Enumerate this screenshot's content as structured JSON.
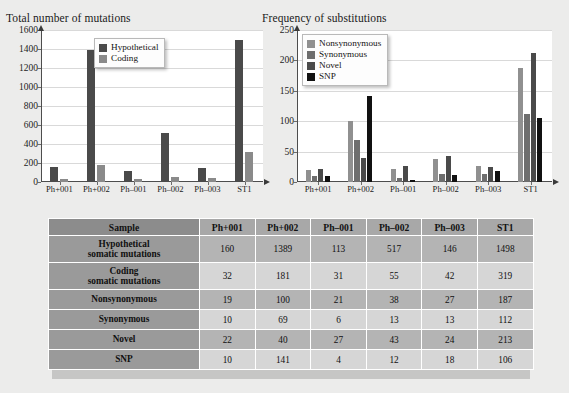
{
  "charts": [
    {
      "title": "Total number of mutations",
      "ylim": [
        0,
        1600
      ],
      "ystep": 200,
      "yticks": [
        "0",
        "200",
        "400",
        "600",
        "800",
        "1000",
        "1200",
        "1400",
        "1600"
      ],
      "categories": [
        "Ph+001",
        "Ph+002",
        "Ph–001",
        "Ph–002",
        "Ph–003",
        "ST1"
      ],
      "legend": [
        {
          "label": "Hypothetical",
          "color": "#4a4a4a"
        },
        {
          "label": "Coding",
          "color": "#8a8a8a"
        }
      ],
      "series": [
        {
          "name": "Hypothetical",
          "color": "#4a4a4a",
          "values": [
            160,
            1389,
            113,
            517,
            146,
            1498
          ]
        },
        {
          "name": "Coding",
          "color": "#8a8a8a",
          "values": [
            32,
            181,
            31,
            55,
            42,
            319
          ]
        }
      ]
    },
    {
      "title": "Frequency of substitutions",
      "ylim": [
        0,
        250
      ],
      "ystep": 50,
      "yticks": [
        "0",
        "50",
        "100",
        "150",
        "200",
        "250"
      ],
      "categories": [
        "Ph+001",
        "Ph+002",
        "Ph–001",
        "Ph–002",
        "Ph–003",
        "ST1"
      ],
      "legend": [
        {
          "label": "Nonsynonymous",
          "color": "#909090"
        },
        {
          "label": "Synonymous",
          "color": "#6e6e6e"
        },
        {
          "label": "Novel",
          "color": "#4a4a4a"
        },
        {
          "label": "SNP",
          "color": "#111111"
        }
      ],
      "series": [
        {
          "name": "Nonsynonymous",
          "color": "#909090",
          "values": [
            19,
            100,
            21,
            38,
            27,
            187
          ]
        },
        {
          "name": "Synonymous",
          "color": "#6e6e6e",
          "values": [
            10,
            69,
            6,
            13,
            13,
            112
          ]
        },
        {
          "name": "Novel",
          "color": "#4a4a4a",
          "values": [
            22,
            40,
            27,
            43,
            24,
            213
          ]
        },
        {
          "name": "SNP",
          "color": "#111111",
          "values": [
            10,
            141,
            4,
            12,
            18,
            106
          ]
        }
      ]
    }
  ],
  "table": {
    "header": [
      "Sample",
      "Ph+001",
      "Ph+002",
      "Ph–001",
      "Ph–002",
      "Ph–003",
      "ST1"
    ],
    "rows": [
      {
        "label": "Hypothetical\nsomatic mutations",
        "label_lines": [
          "Hypothetical",
          "somatic mutations"
        ],
        "values": [
          "160",
          "1389",
          "113",
          "517",
          "146",
          "1498"
        ]
      },
      {
        "label": "Coding\nsomatic mutations",
        "label_lines": [
          "Coding",
          "somatic mutations"
        ],
        "values": [
          "32",
          "181",
          "31",
          "55",
          "42",
          "319"
        ]
      },
      {
        "label": "Nonsynonymous",
        "label_lines": [
          "Nonsynonymous"
        ],
        "values": [
          "19",
          "100",
          "21",
          "38",
          "27",
          "187"
        ]
      },
      {
        "label": "Synonymous",
        "label_lines": [
          "Synonymous"
        ],
        "values": [
          "10",
          "69",
          "6",
          "13",
          "13",
          "112"
        ]
      },
      {
        "label": "Novel",
        "label_lines": [
          "Novel"
        ],
        "values": [
          "22",
          "40",
          "27",
          "43",
          "24",
          "213"
        ]
      },
      {
        "label": "SNP",
        "label_lines": [
          "10",
          "141",
          "4",
          "12",
          "18",
          "106"
        ],
        "values": [
          "10",
          "141",
          "4",
          "12",
          "18",
          "106"
        ]
      }
    ],
    "row_labels": [
      "Hypothetical somatic mutations",
      "Coding somatic mutations",
      "Nonsynonymous",
      "Synonymous",
      "Novel",
      "SNP"
    ]
  },
  "chart_data": [
    {
      "type": "bar",
      "title": "Total number of mutations",
      "xlabel": "",
      "ylabel": "",
      "ylim": [
        0,
        1600
      ],
      "grid": true,
      "legend_position": "top-center",
      "categories": [
        "Ph+001",
        "Ph+002",
        "Ph–001",
        "Ph–002",
        "Ph–003",
        "ST1"
      ],
      "tick_labels_y": [
        0,
        200,
        400,
        600,
        800,
        1000,
        1200,
        1400,
        1600
      ],
      "series": [
        {
          "name": "Hypothetical",
          "values": [
            160,
            1389,
            113,
            517,
            146,
            1498
          ]
        },
        {
          "name": "Coding",
          "values": [
            32,
            181,
            31,
            55,
            42,
            319
          ]
        }
      ]
    },
    {
      "type": "bar",
      "title": "Frequency of substitutions",
      "xlabel": "",
      "ylabel": "",
      "ylim": [
        0,
        250
      ],
      "grid": true,
      "legend_position": "top-left",
      "categories": [
        "Ph+001",
        "Ph+002",
        "Ph–001",
        "Ph–002",
        "Ph–003",
        "ST1"
      ],
      "tick_labels_y": [
        0,
        50,
        100,
        150,
        200,
        250
      ],
      "series": [
        {
          "name": "Nonsynonymous",
          "values": [
            19,
            100,
            21,
            38,
            27,
            187
          ]
        },
        {
          "name": "Synonymous",
          "values": [
            10,
            69,
            6,
            13,
            13,
            112
          ]
        },
        {
          "name": "Novel",
          "values": [
            22,
            40,
            27,
            43,
            24,
            213
          ]
        },
        {
          "name": "SNP",
          "values": [
            10,
            141,
            4,
            12,
            18,
            106
          ]
        }
      ]
    },
    {
      "type": "table",
      "title": "Sample mutation summary",
      "columns": [
        "Sample",
        "Ph+001",
        "Ph+002",
        "Ph–001",
        "Ph–002",
        "Ph–003",
        "ST1"
      ],
      "rows": [
        [
          "Hypothetical somatic mutations",
          "160",
          "1389",
          "113",
          "517",
          "146",
          "1498"
        ],
        [
          "Coding somatic mutations",
          "32",
          "181",
          "31",
          "55",
          "42",
          "319"
        ],
        [
          "Nonsynonymous",
          "19",
          "100",
          "21",
          "38",
          "27",
          "187"
        ],
        [
          "Synonymous",
          "10",
          "69",
          "6",
          "13",
          "13",
          "112"
        ],
        [
          "Novel",
          "22",
          "40",
          "27",
          "43",
          "24",
          "213"
        ],
        [
          "SNP",
          "10",
          "141",
          "4",
          "12",
          "18",
          "106"
        ]
      ]
    }
  ]
}
